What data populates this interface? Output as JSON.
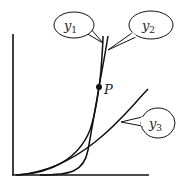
{
  "diagram": {
    "type": "function-growth-comparison",
    "axes": {
      "x_axis": "horizontal",
      "y_axis": "vertical",
      "x_labels": [],
      "y_labels": []
    },
    "curves": [
      {
        "id": "y1",
        "name": "y",
        "subscript": "1",
        "shape": "steep exponential-like curve"
      },
      {
        "id": "y2",
        "name": "y",
        "subscript": "2",
        "shape": "very steep curve"
      },
      {
        "id": "y3",
        "name": "y",
        "subscript": "3",
        "shape": "gently rising curve"
      }
    ],
    "point": {
      "label": "P",
      "description": "intersection of y1 and y2"
    },
    "colors": {
      "stroke": "#111111",
      "background": "#ffffff"
    }
  }
}
